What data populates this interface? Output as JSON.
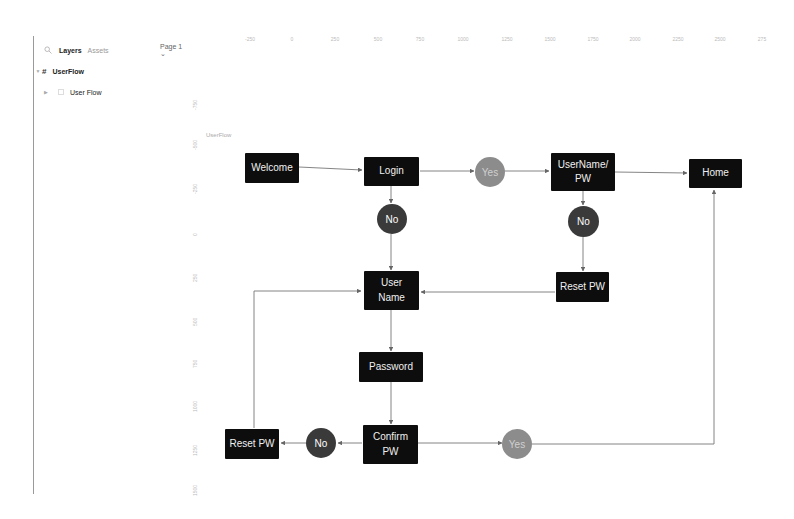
{
  "sidebar": {
    "tabs": [
      {
        "label": "Layers",
        "active": true
      },
      {
        "label": "Assets",
        "active": false
      }
    ],
    "page_selector": "Page 1 ⌄",
    "layers": [
      {
        "name": "UserFlow",
        "type": "frame",
        "expanded": true
      },
      {
        "name": "User Flow",
        "type": "group",
        "indent": 1
      }
    ]
  },
  "rulers": {
    "horizontal": [
      "-250",
      "0",
      "250",
      "500",
      "750",
      "1000",
      "1250",
      "1500",
      "1750",
      "2000",
      "2250",
      "2500",
      "275"
    ],
    "vertical": [
      "-750",
      "-500",
      "-250",
      "0",
      "250",
      "500",
      "750",
      "1000",
      "1250",
      "1500"
    ]
  },
  "canvas": {
    "frame_label": "UserFlow",
    "colors": {
      "node_bg": "#0d0d0d",
      "no_circle": "#3a3a3a",
      "yes_circle": "#8c8c8c",
      "connector": "#777777"
    },
    "nodes": {
      "welcome": "Welcome",
      "login": "Login",
      "username_pw": "UserName/ PW",
      "home": "Home",
      "reset_pw_top": "Reset PW",
      "user_name": "User Name",
      "password": "Password",
      "confirm_pw": "Confirm PW",
      "reset_pw_bottom": "Reset PW"
    },
    "decisions": {
      "yes_login": "Yes",
      "no_login": "No",
      "no_username_pw": "No",
      "no_confirm": "No",
      "yes_confirm": "Yes"
    }
  }
}
